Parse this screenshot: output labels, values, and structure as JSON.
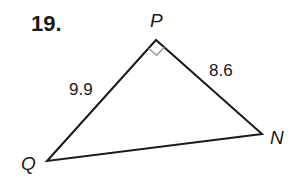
{
  "problem": {
    "number": "19."
  },
  "triangle": {
    "vertices": [
      {
        "name": "P",
        "x": 156,
        "y": 40,
        "label_x": 150,
        "label_y": 27
      },
      {
        "name": "Q",
        "x": 47,
        "y": 161,
        "label_x": 21,
        "label_y": 170
      },
      {
        "name": "N",
        "x": 262,
        "y": 134,
        "label_x": 270,
        "label_y": 144
      }
    ],
    "sides": [
      {
        "between": "QP",
        "length": "9.9",
        "label_x": 69,
        "label_y": 95
      },
      {
        "between": "PN",
        "length": "8.6",
        "label_x": 209,
        "label_y": 76
      }
    ],
    "right_angle_at": "P",
    "colors": {
      "line": "#1a1a1a",
      "right_angle_marker": "#999999"
    }
  }
}
